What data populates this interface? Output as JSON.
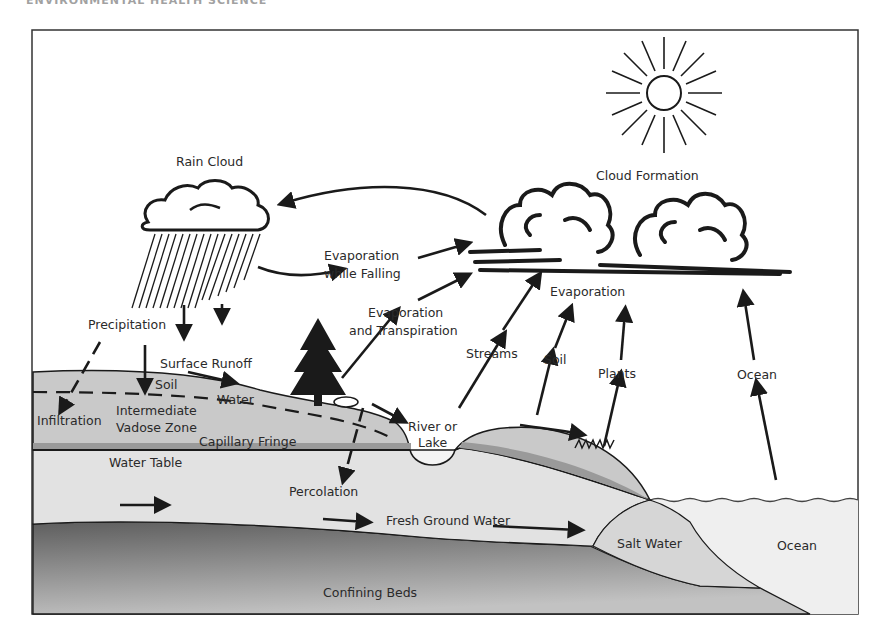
{
  "header": {
    "text": "ENVIRONMENTAL HEALTH SCIENCE"
  },
  "diagram": {
    "labels": {
      "rain_cloud": "Rain Cloud",
      "cloud_formation": "Cloud Formation",
      "evaporation_while_falling_1": "Evaporation",
      "evaporation_while_falling_2": "while Falling",
      "evap_transpiration_1": "Evaporation",
      "evap_transpiration_2": "and Transpiration",
      "evaporation": "Evaporation",
      "precipitation": "Precipitation",
      "surface_runoff": "Surface Runoff",
      "soil_zone": "Soil",
      "water_zone": "Water",
      "infiltration": "Infiltration",
      "intermediate_1": "Intermediate",
      "intermediate_2": "Vadose Zone",
      "capillary_fringe": "Capillary Fringe",
      "water_table": "Water Table",
      "percolation": "Percolation",
      "river_1": "River or",
      "river_2": "Lake",
      "streams": "Streams",
      "soil_source": "Soil",
      "plants": "Plants",
      "ocean_source": "Ocean",
      "fresh_ground_water": "Fresh Ground Water",
      "salt_water": "Salt Water",
      "ocean": "Ocean",
      "confining_beds": "Confining Beds"
    },
    "colors": {
      "soil_fill": "#c9c9c9",
      "capillary_band": "#9a9a9a",
      "groundwater_fill": "#e2e2e2",
      "confining_dark": "#6a6a6a",
      "confining_light": "#b8b8b8",
      "ocean_fill": "#f0f0f0",
      "line": "#1a1a1a"
    }
  }
}
